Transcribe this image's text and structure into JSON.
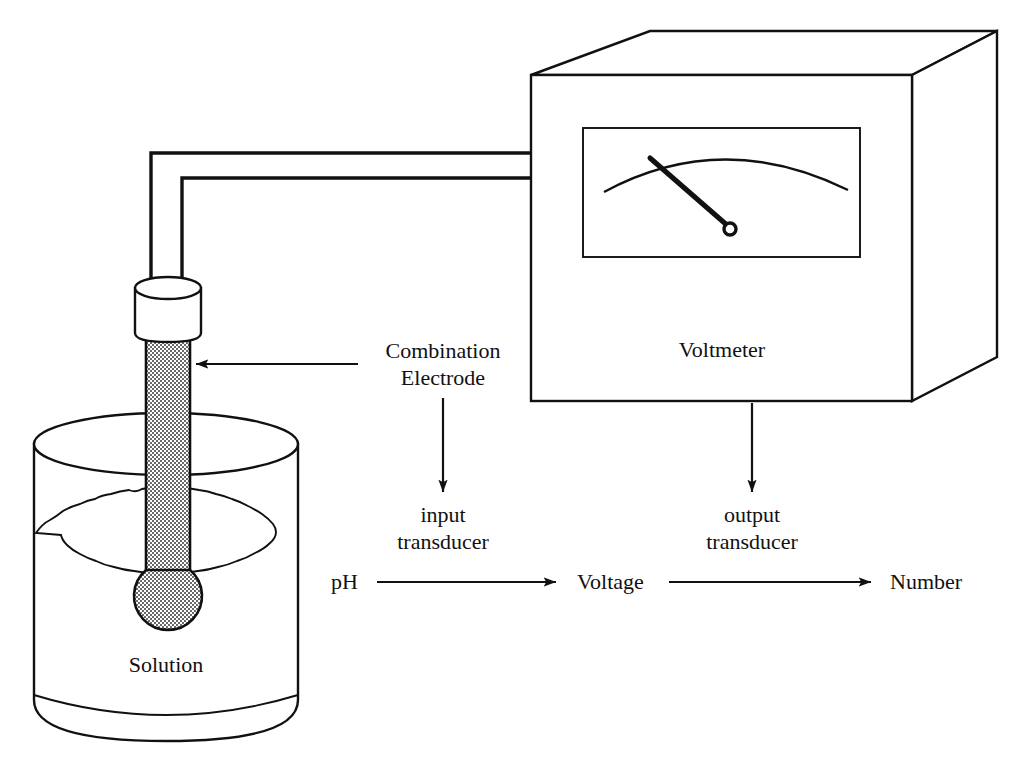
{
  "figure": {
    "kind": "ph-meter-transducer-diagram",
    "background": "#ffffff",
    "ink": "#111111"
  },
  "labels": {
    "solution": "Solution",
    "combination_electrode_line1": "Combination",
    "combination_electrode_line2": "Electrode",
    "voltmeter": "Voltmeter",
    "input_transducer_line1": "input",
    "input_transducer_line2": "transducer",
    "output_transducer_line1": "output",
    "output_transducer_line2": "transducer"
  },
  "signal_chain": {
    "nodes": [
      "pH",
      "Voltage",
      "Number"
    ],
    "arrows": [
      "pH-to-voltage",
      "voltage-to-number"
    ]
  },
  "annotations": {
    "electrode_pointer": "arrow-pointing-to-electrode-stem",
    "input_pointer": "arrow-from-electrode-label-to-input-transducer",
    "output_pointer": "arrow-from-voltmeter-to-output-transducer"
  },
  "apparatus": {
    "beaker": "open-cylindrical-beaker-with-solution",
    "electrode": "combination-ph-electrode-with-bulb",
    "wires": [
      "upper-lead-wire",
      "lower-lead-wire"
    ],
    "voltmeter": "analog-panel-voltmeter-box",
    "meter_face": "arc-scale-with-needle"
  }
}
